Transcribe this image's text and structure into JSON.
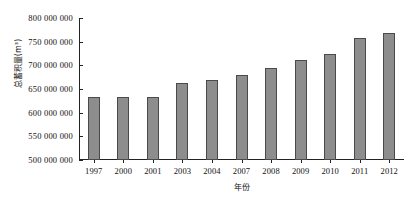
{
  "chart_data": {
    "type": "bar",
    "title": "",
    "xlabel": "年份",
    "ylabel": "总蓄积量(m³)",
    "categories": [
      "1997",
      "2000",
      "2001",
      "2003",
      "2004",
      "2007",
      "2008",
      "2009",
      "2010",
      "2011",
      "2012"
    ],
    "values": [
      633000000,
      633000000,
      633000000,
      663000000,
      669000000,
      680000000,
      695000000,
      712000000,
      723000000,
      758000000,
      768000000
    ],
    "ylim": [
      500000000,
      800000000
    ],
    "ytick_values": [
      800000000,
      750000000,
      700000000,
      650000000,
      600000000,
      550000000,
      500000000
    ],
    "ytick_labels": [
      "800 000 000",
      "750 000 000",
      "700 000 000",
      "650 000 000",
      "600 000 000",
      "550 000 000",
      "500 000 000"
    ],
    "grid": false,
    "legend": null,
    "bar_color": "#8d8d8d",
    "bar_edge_color": "#4a4a4a",
    "axis_color": "#222222"
  }
}
